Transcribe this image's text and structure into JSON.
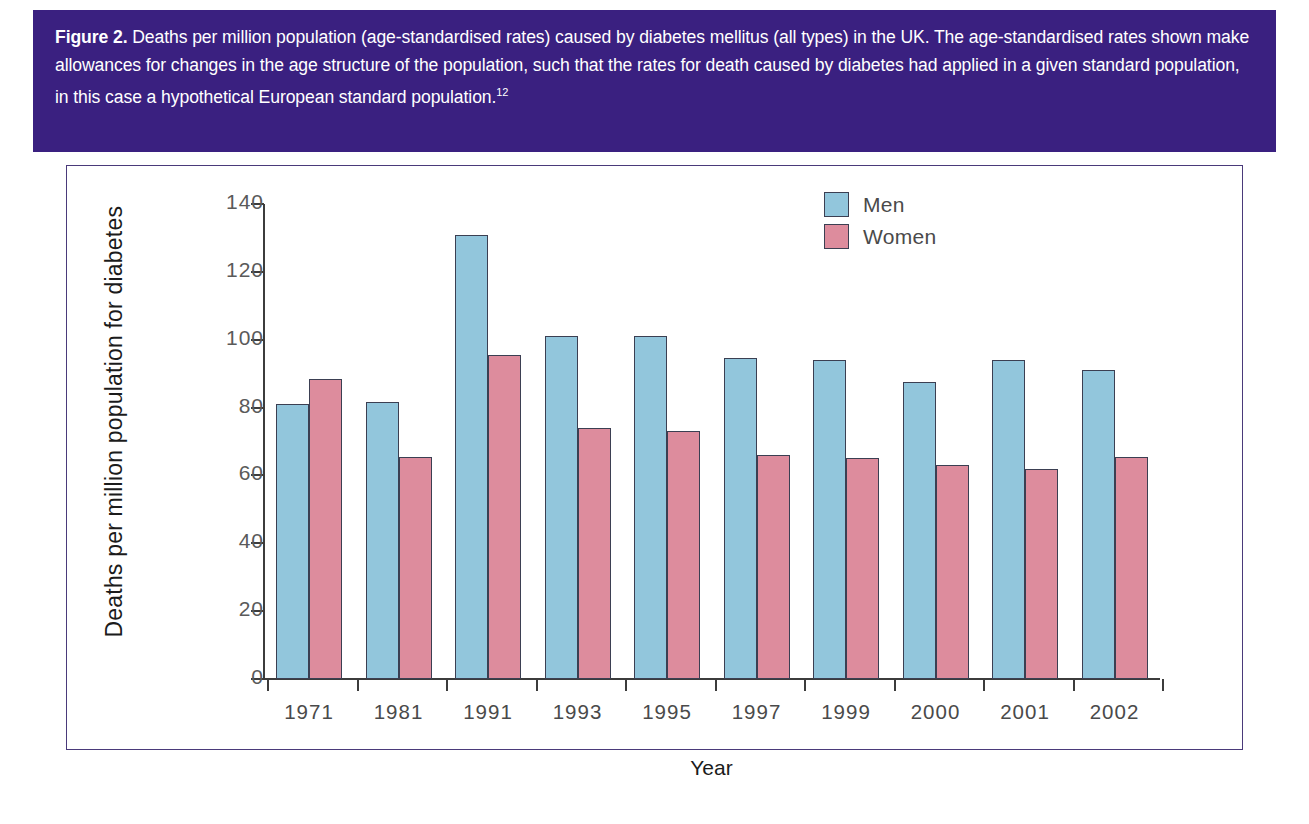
{
  "figure": {
    "label": "Figure 2.",
    "caption": " Deaths per million population (age-standardised rates) caused by diabetes mellitus (all types) in the UK. The age-standardised rates shown make allowances for changes in the age structure of the population, such that the rates for death caused by diabetes had applied in a given standard population, in this case a hypothetical European standard population.",
    "reference": "12"
  },
  "colors": {
    "caption_background": "#3a2080",
    "caption_text": "#ffffff",
    "men": "#92c6dc",
    "women": "#dd8c9d",
    "bar_outline": "#3b3f52",
    "axis": "#3c3c3c",
    "panel_border": "#4a3a7a"
  },
  "chart_data": {
    "type": "bar",
    "title": "",
    "xlabel": "Year",
    "ylabel": "Deaths per million population for diabetes",
    "categories": [
      "1971",
      "1981",
      "1991",
      "1993",
      "1995",
      "1997",
      "1999",
      "2000",
      "2001",
      "2002"
    ],
    "series": [
      {
        "name": "Men",
        "color": "#92c6dc",
        "values": [
          81,
          81.5,
          131,
          101,
          101,
          94.5,
          94,
          87.5,
          94,
          91
        ]
      },
      {
        "name": "Women",
        "color": "#dd8c9d",
        "values": [
          88.5,
          65.5,
          95.5,
          74,
          73,
          66,
          65,
          63,
          62,
          65.5
        ]
      }
    ],
    "ylim": [
      0,
      140
    ],
    "yticks": [
      0,
      20,
      40,
      60,
      80,
      100,
      120,
      140
    ],
    "ytick_labels": [
      "0",
      "20",
      "40",
      "60",
      "80",
      "100",
      "120",
      "140"
    ],
    "grid": false,
    "legend_position": "top-right",
    "legend_entries": [
      "Men",
      "Women"
    ]
  }
}
